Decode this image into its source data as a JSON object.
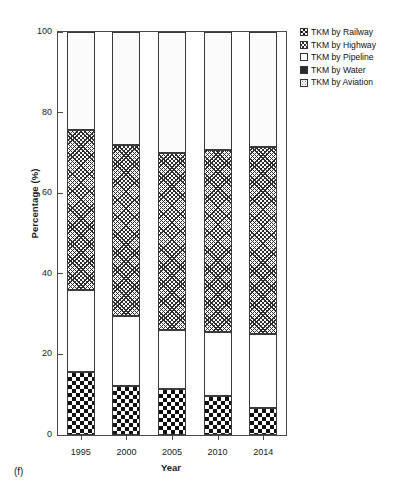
{
  "caption": "(f)",
  "axes": {
    "ylabel": "Percentage (%)",
    "xlabel": "Year",
    "yticks": [
      "0",
      "20",
      "40",
      "60",
      "80",
      "100"
    ],
    "xticks": [
      "1995",
      "2000",
      "2005",
      "2010",
      "2014"
    ]
  },
  "legend": {
    "items": [
      {
        "label": "TKM by Railway",
        "pattern": "checkerboard"
      },
      {
        "label": "TKM by Highway",
        "pattern": "dark-cross-hatch"
      },
      {
        "label": "TKM by Pipeline",
        "pattern": "white"
      },
      {
        "label": "TKM by Water",
        "pattern": "solid-dark"
      },
      {
        "label": "TKM by Aviation",
        "pattern": "light-stipple"
      }
    ]
  },
  "chart_data": {
    "type": "bar",
    "subtype": "stacked-percentage",
    "title": "",
    "subtitle": "",
    "xlabel": "Year",
    "ylabel": "Percentage (%)",
    "ylim": [
      0,
      100
    ],
    "ytick_step": 20,
    "grid": false,
    "legend_position": "right-top",
    "categories": [
      "1995",
      "2000",
      "2005",
      "2010",
      "2014"
    ],
    "series": [
      {
        "name": "TKM by Railway",
        "values": [
          15.6,
          12.2,
          11.4,
          9.7,
          6.7
        ]
      },
      {
        "name": "TKM by Pipeline",
        "values": [
          20.4,
          17.3,
          14.6,
          15.9,
          18.3
        ]
      },
      {
        "name": "TKM by Highway",
        "values": [
          39.6,
          42.5,
          44.0,
          45.1,
          46.5
        ]
      },
      {
        "name": "TKM by Water",
        "values": [
          0.0,
          0.0,
          0.0,
          0.0,
          0.0
        ]
      },
      {
        "name": "TKM by Aviation",
        "values": [
          24.4,
          28.0,
          30.0,
          29.3,
          28.5
        ]
      }
    ],
    "stack_order_bottom_to_top": [
      "TKM by Railway",
      "TKM by Pipeline",
      "TKM by Highway",
      "TKM by Water",
      "TKM by Aviation"
    ]
  }
}
